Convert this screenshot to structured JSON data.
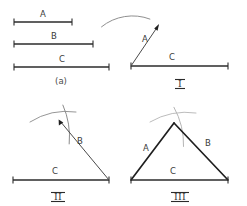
{
  "figure": {
    "background_color": "#ffffff",
    "ink_color": "#2b2b2b",
    "arc_color": "#8a8a8a",
    "width": 247,
    "height": 206
  },
  "panels": [
    {
      "id": "a",
      "label": "(a)",
      "label_x": 61,
      "label_y": 84,
      "caption_style": "parenthetical",
      "description": "Three given line segments of differing lengths, each drawn with tick end-caps.",
      "segments": [
        {
          "name": "A",
          "label": "A",
          "x1": 14,
          "x2": 72,
          "y": 22,
          "length_px": 58,
          "label_x": 43,
          "label_y": 17
        },
        {
          "name": "B",
          "label": "B",
          "x1": 14,
          "x2": 93,
          "y": 44,
          "length_px": 79,
          "label_x": 54,
          "label_y": 39
        },
        {
          "name": "C",
          "label": "C",
          "x1": 14,
          "x2": 109,
          "y": 67,
          "length_px": 95,
          "label_x": 62,
          "label_y": 62
        }
      ]
    },
    {
      "id": "I",
      "label": "I",
      "label_x": 180,
      "label_y": 84,
      "description": "Baseline C drawn; segment A swung from the left endpoint, arc struck with compass radius A.",
      "baseline": {
        "label": "C",
        "x1": 131,
        "x2": 228,
        "y": 66,
        "label_x": 172,
        "label_y": 60
      },
      "ray": {
        "label": "A",
        "x1": 131,
        "y1": 66,
        "x2": 159,
        "y2": 25,
        "label_x": 145,
        "label_y": 42
      },
      "arrow_at": {
        "x": 159,
        "y": 25,
        "direction": "up-right"
      },
      "arcs": [
        {
          "name": "arc-radius-A",
          "cx": 131,
          "cy": 66,
          "r": 49,
          "from_deg": 118,
          "to_deg": 58
        }
      ]
    },
    {
      "id": "II",
      "label": "II",
      "label_x": 58,
      "label_y": 197,
      "description": "Segment B swung from the right endpoint of C; second arc struck, crossing the first arc at the apex.",
      "baseline": {
        "label": "C",
        "x1": 13,
        "x2": 109,
        "y": 180,
        "label_x": 55,
        "label_y": 174
      },
      "ray": {
        "label": "B",
        "x1": 109,
        "y1": 180,
        "x2": 59,
        "y2": 120,
        "label_x": 80,
        "label_y": 144
      },
      "arrow_at": {
        "x": 59,
        "y": 120,
        "direction": "up-left"
      },
      "arcs": [
        {
          "name": "arc-radius-A",
          "cx": 13,
          "cy": 180,
          "r": 68,
          "from_deg": 110,
          "to_deg": 46
        },
        {
          "name": "arc-radius-B",
          "cx": 109,
          "cy": 180,
          "r": 78,
          "from_deg": 133,
          "to_deg": 97
        }
      ]
    },
    {
      "id": "III",
      "label": "III",
      "label_x": 180,
      "label_y": 197,
      "description": "Completed triangle: apex at the arc intersection joined to both ends of baseline C.",
      "baseline": {
        "label": "C",
        "x1": 131,
        "x2": 228,
        "y": 180,
        "label_x": 173,
        "label_y": 174
      },
      "apex": {
        "x": 174,
        "y": 123
      },
      "sides": [
        {
          "name": "A",
          "label": "A",
          "from": "left-endpoint",
          "label_x": 146,
          "label_y": 151
        },
        {
          "name": "B",
          "label": "B",
          "from": "right-endpoint",
          "label_x": 208,
          "label_y": 146
        },
        {
          "name": "C",
          "label": "C",
          "from": "baseline",
          "label_x": 173,
          "label_y": 174
        }
      ],
      "arcs": [
        {
          "name": "arc-radius-A",
          "cx": 131,
          "cy": 180,
          "r": 71,
          "from_deg": 108,
          "to_deg": 44
        },
        {
          "name": "arc-radius-B",
          "cx": 228,
          "cy": 180,
          "r": 76,
          "from_deg": 136,
          "to_deg": 100
        }
      ]
    }
  ]
}
